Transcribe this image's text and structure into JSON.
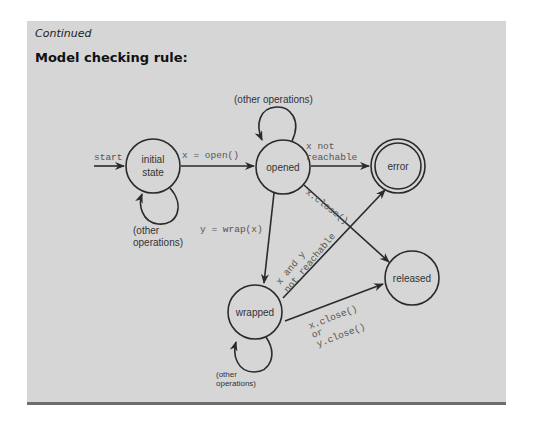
{
  "header": {
    "continued": "Continued",
    "title": "Model checking rule:"
  },
  "diagram": {
    "states": {
      "initial_line1": "initial",
      "initial_line2": "state",
      "opened": "opened",
      "error": "error",
      "released": "released",
      "wrapped": "wrapped"
    },
    "edges": {
      "start": "start",
      "open": "x = open()",
      "not_reachable_1": "x not",
      "not_reachable_2": "reachable",
      "x_close": "x.close()",
      "wrap": "y = wrap(x)",
      "xy_nr_1": "x and y",
      "xy_nr_2": "not reachable",
      "xy_close_1": "x.close()",
      "xy_close_2": "or",
      "xy_close_3": "y.close()",
      "other_ops_top": "(other operations)",
      "other_ops_initial_1": "(other",
      "other_ops_initial_2": "operations)",
      "other_ops_wrapped_1": "(other",
      "other_ops_wrapped_2": "operations)"
    },
    "colors": {
      "panel": "#d6d6d6",
      "rule": "#6e6e6e",
      "stroke": "#2a2a2a"
    }
  }
}
